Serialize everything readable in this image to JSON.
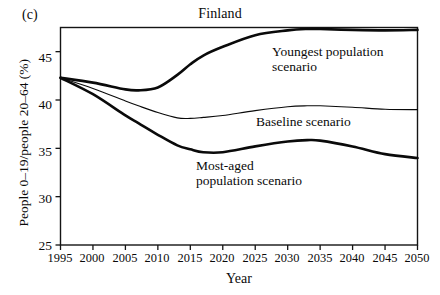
{
  "panel_tag": "(c)",
  "chart_data": {
    "type": "line",
    "title": "Finland",
    "xlabel": "Year",
    "ylabel": "People 0–19/people 20–64 (%)",
    "xlim": [
      1995,
      2050
    ],
    "ylim": [
      25,
      47.5
    ],
    "grid": false,
    "legend_position": "inline-annotations",
    "xticks": [
      1995,
      2000,
      2005,
      2010,
      2015,
      2020,
      2025,
      2030,
      2035,
      2040,
      2045,
      2050
    ],
    "yticks": [
      25,
      30,
      35,
      40,
      45
    ],
    "x": [
      1995,
      2000,
      2005,
      2007,
      2010,
      2013,
      2015,
      2017,
      2020,
      2025,
      2030,
      2033,
      2035,
      2040,
      2045,
      2050
    ],
    "series": [
      {
        "name": "Youngest population scenario",
        "label": "Youngest population\nscenario",
        "color": "#0a0a0a",
        "line_width": 2.6,
        "values": [
          42.3,
          41.8,
          41.1,
          41.0,
          41.3,
          42.6,
          43.7,
          44.6,
          45.5,
          46.7,
          47.2,
          47.35,
          47.35,
          47.25,
          47.2,
          47.25
        ]
      },
      {
        "name": "Baseline scenario",
        "label": "Baseline scenario",
        "color": "#0a0a0a",
        "line_width": 1.1,
        "values": [
          42.3,
          41.2,
          39.9,
          39.4,
          38.7,
          38.15,
          38.1,
          38.2,
          38.4,
          38.9,
          39.3,
          39.4,
          39.4,
          39.25,
          39.05,
          39.0
        ]
      },
      {
        "name": "Most-aged population scenario",
        "label": "Most-aged\npopulation scenario",
        "color": "#0a0a0a",
        "line_width": 2.6,
        "values": [
          42.3,
          40.6,
          38.4,
          37.6,
          36.4,
          35.3,
          34.9,
          34.6,
          34.6,
          35.2,
          35.7,
          35.85,
          35.8,
          35.2,
          34.4,
          34.0
        ]
      }
    ]
  },
  "annotations": {
    "youngest": "Youngest population\nscenario",
    "baseline": "Baseline scenario",
    "most_aged": "Most-aged\npopulation scenario"
  }
}
